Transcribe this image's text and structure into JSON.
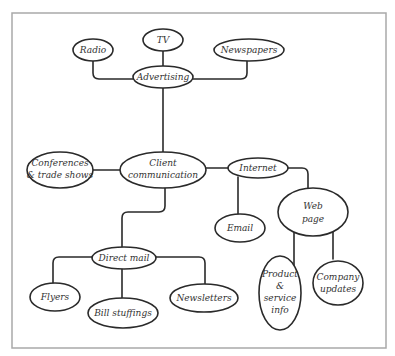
{
  "diagram": {
    "type": "mind-map",
    "frame": {
      "x": 12,
      "y": 13,
      "width": 374,
      "height": 335
    },
    "colors": {
      "line": "#2a2a2a",
      "frame": "#a9a9a9",
      "text": "#333333",
      "background": "#ffffff"
    },
    "nodes": {
      "tv": {
        "lines": [
          "TV"
        ]
      },
      "radio": {
        "lines": [
          "Radio"
        ]
      },
      "newspapers": {
        "lines": [
          "Newspapers"
        ]
      },
      "advertising": {
        "lines": [
          "Advertising"
        ]
      },
      "conferences": {
        "lines": [
          "Conferences",
          "& trade shows"
        ]
      },
      "client": {
        "lines": [
          "Client",
          "communication"
        ]
      },
      "internet": {
        "lines": [
          "Internet"
        ]
      },
      "email": {
        "lines": [
          "Email"
        ]
      },
      "webpage": {
        "lines": [
          "Web",
          "page"
        ]
      },
      "directmail": {
        "lines": [
          "Direct mail"
        ]
      },
      "flyers": {
        "lines": [
          "Flyers"
        ]
      },
      "bill": {
        "lines": [
          "Bill stuffings"
        ]
      },
      "newsletters": {
        "lines": [
          "Newsletters"
        ]
      },
      "product": {
        "lines": [
          "Product",
          "&",
          "service",
          "info"
        ]
      },
      "company": {
        "lines": [
          "Company",
          "updates"
        ]
      }
    },
    "edges": [
      [
        "advertising",
        "tv"
      ],
      [
        "advertising",
        "radio"
      ],
      [
        "advertising",
        "newspapers"
      ],
      [
        "client",
        "advertising"
      ],
      [
        "client",
        "conferences"
      ],
      [
        "client",
        "internet"
      ],
      [
        "client",
        "directmail"
      ],
      [
        "internet",
        "email"
      ],
      [
        "internet",
        "webpage"
      ],
      [
        "webpage",
        "product"
      ],
      [
        "webpage",
        "company"
      ],
      [
        "directmail",
        "flyers"
      ],
      [
        "directmail",
        "bill"
      ],
      [
        "directmail",
        "newsletters"
      ]
    ]
  }
}
